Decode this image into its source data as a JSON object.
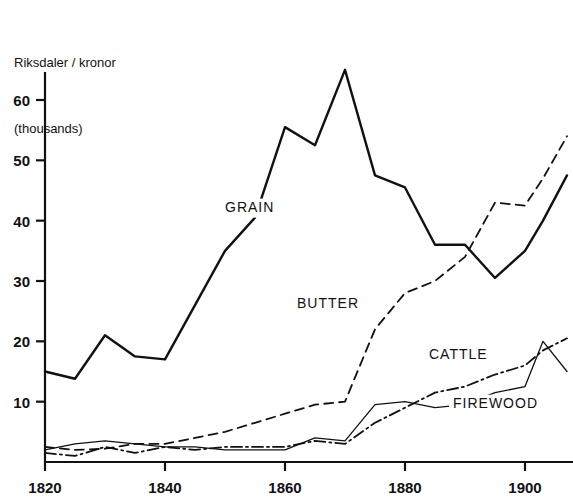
{
  "chart_data": {
    "type": "line",
    "title": "Riksdaler / kronor\n(thousands)",
    "title_line1": "Riksdaler / kronor",
    "title_line2": "(thousands)",
    "xlabel": "",
    "ylabel": "Riksdaler / kronor (thousands)",
    "xlim": [
      1820,
      1908
    ],
    "ylim": [
      0,
      68
    ],
    "xticks": [
      1820,
      1840,
      1860,
      1880,
      1900
    ],
    "yticks": [
      10,
      20,
      30,
      40,
      50,
      60
    ],
    "grid": false,
    "legend": "inline-annotations",
    "series": [
      {
        "name": "GRAIN",
        "style": "solid",
        "label_x": 1850,
        "label_y": 41.5,
        "x": [
          1820,
          1825,
          1830,
          1835,
          1840,
          1845,
          1850,
          1855,
          1860,
          1865,
          1870,
          1875,
          1880,
          1885,
          1890,
          1895,
          1900,
          1903,
          1907
        ],
        "y": [
          15.0,
          13.8,
          21.0,
          17.5,
          17.0,
          26.0,
          35.0,
          40.5,
          55.5,
          52.5,
          65.0,
          47.5,
          45.5,
          36.0,
          36.0,
          30.5,
          35.0,
          40.0,
          47.5
        ]
      },
      {
        "name": "BUTTER",
        "style": "dashed",
        "label_x": 1862,
        "label_y": 25.5,
        "x": [
          1820,
          1825,
          1830,
          1835,
          1840,
          1845,
          1850,
          1855,
          1860,
          1865,
          1870,
          1875,
          1880,
          1885,
          1890,
          1895,
          1900,
          1903,
          1907
        ],
        "y": [
          2.5,
          2.0,
          2.2,
          3.0,
          3.0,
          4.0,
          5.0,
          6.5,
          8.0,
          9.5,
          10.0,
          22.0,
          28.0,
          30.0,
          34.0,
          43.0,
          42.5,
          47.0,
          54.0
        ]
      },
      {
        "name": "CATTLE",
        "style": "dash-dot",
        "label_x": 1884,
        "label_y": 17.0,
        "x": [
          1820,
          1825,
          1830,
          1835,
          1840,
          1845,
          1850,
          1855,
          1860,
          1865,
          1870,
          1875,
          1880,
          1885,
          1890,
          1895,
          1900,
          1903,
          1907
        ],
        "y": [
          1.5,
          1.0,
          2.5,
          1.5,
          2.5,
          2.0,
          2.5,
          2.5,
          2.5,
          3.5,
          3.0,
          6.5,
          9.0,
          11.5,
          12.5,
          14.5,
          16.0,
          18.5,
          20.5
        ]
      },
      {
        "name": "FIREWOOD",
        "style": "solid-thin",
        "label_x": 1888,
        "label_y": 9.0,
        "x": [
          1820,
          1825,
          1830,
          1835,
          1840,
          1845,
          1850,
          1855,
          1860,
          1865,
          1870,
          1875,
          1880,
          1885,
          1890,
          1895,
          1900,
          1903,
          1907
        ],
        "y": [
          2.0,
          3.0,
          3.5,
          3.0,
          2.5,
          2.5,
          2.0,
          2.0,
          2.0,
          4.0,
          3.5,
          9.5,
          10.0,
          9.0,
          9.5,
          11.5,
          12.5,
          20.0,
          15.0
        ]
      }
    ]
  }
}
